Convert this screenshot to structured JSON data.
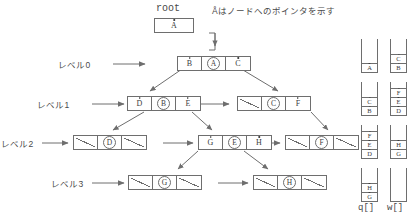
{
  "diagram": {
    "title_root": "root",
    "legend_note": "Åはノードへのポインタを示す",
    "root_node": {
      "pointer": "A"
    },
    "level_labels": [
      {
        "text": "レベル0"
      },
      {
        "text": "レベル1"
      },
      {
        "text": "レベル2"
      },
      {
        "text": "レベル3"
      }
    ],
    "levels": [
      {
        "label": "レベル0",
        "nodes": [
          {
            "left": "B",
            "key": "A",
            "right": "C"
          }
        ]
      },
      {
        "label": "レベル1",
        "nodes": [
          {
            "left": "D",
            "key": "B",
            "right": "E"
          },
          {
            "left": null,
            "key": "C",
            "right": "F"
          }
        ]
      },
      {
        "label": "レベル2",
        "nodes": [
          {
            "left": null,
            "key": "D",
            "right": null
          },
          {
            "left": "G",
            "key": "E",
            "right": "H"
          },
          {
            "left": null,
            "key": "F",
            "right": null
          }
        ]
      },
      {
        "label": "レベル3",
        "nodes": [
          {
            "left": null,
            "key": "G",
            "right": null
          },
          {
            "left": null,
            "key": "H",
            "right": null
          }
        ]
      }
    ],
    "stacks": {
      "q": {
        "caption": "q[]",
        "frames": [
          {
            "items": [
              "A"
            ]
          },
          {
            "items": [
              "C",
              "B"
            ]
          },
          {
            "items": [
              "F",
              "E",
              "D"
            ]
          },
          {
            "items": [
              "H",
              "G"
            ]
          }
        ]
      },
      "w": {
        "caption": "w[]",
        "frames": [
          {
            "items": [
              "C",
              "B"
            ]
          },
          {
            "items": [
              "F",
              "E",
              "D"
            ]
          },
          {
            "items": [
              "H",
              "G"
            ]
          },
          {
            "items": []
          }
        ]
      }
    },
    "colors": {
      "ink": "#4a4a4a",
      "line": "#6e6e6e",
      "background": "#ffffff"
    }
  }
}
